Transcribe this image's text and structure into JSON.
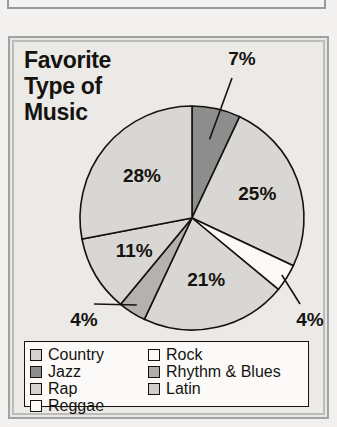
{
  "figure": {
    "title": "Favorite\nType of\nMusic"
  },
  "chart_data": {
    "type": "pie",
    "title": "Favorite Type of Music",
    "xlabel": "",
    "ylabel": "",
    "legend_position": "bottom",
    "grid": false,
    "units": "%",
    "categories": [
      "Country",
      "Jazz",
      "Rap",
      "Reggae",
      "Rock",
      "Rhythm & Blues",
      "Latin"
    ],
    "slices": [
      {
        "label": "Jazz",
        "value": 7,
        "display": "7%",
        "color": "#8d8d8d",
        "swatch": "#8d8d8d",
        "leader": true
      },
      {
        "label": "Rock",
        "value": 25,
        "display": "25%",
        "color": "#d9d7d3",
        "swatch": "#fbfaf8",
        "leader": false
      },
      {
        "label": "Reggae",
        "value": 4,
        "display": "4%",
        "color": "#fbfaf8",
        "swatch": "#fbfaf8",
        "leader": true
      },
      {
        "label": "Latin",
        "value": 21,
        "display": "21%",
        "color": "#d9d7d3",
        "swatch": "#cfcdc9",
        "leader": false
      },
      {
        "label": "Rhythm & Blues",
        "value": 4,
        "display": "4%",
        "color": "#b4b2ae",
        "swatch": "#b0aeaa",
        "leader": true
      },
      {
        "label": "Rap",
        "value": 11,
        "display": "11%",
        "color": "#d9d7d3",
        "swatch": "#d5d3cf",
        "leader": false
      },
      {
        "label": "Country",
        "value": 28,
        "display": "28%",
        "color": "#d9d7d3",
        "swatch": "#d5d3cf",
        "leader": false
      }
    ],
    "values": [
      7,
      25,
      4,
      21,
      4,
      11,
      28
    ],
    "labels": [
      "7%",
      "25%",
      "4%",
      "21%",
      "4%",
      "11%",
      "28%"
    ],
    "legend": [
      {
        "label": "Country",
        "color": "#d5d3cf"
      },
      {
        "label": "Rock",
        "color": "#fbfaf8"
      },
      {
        "label": "Jazz",
        "color": "#8d8d8d"
      },
      {
        "label": "Rhythm & Blues",
        "color": "#b0aeaa"
      },
      {
        "label": "Rap",
        "color": "#d5d3cf"
      },
      {
        "label": "Latin",
        "color": "#cfcdc9"
      },
      {
        "label": "Reggae",
        "color": "#fbfaf8"
      }
    ]
  }
}
